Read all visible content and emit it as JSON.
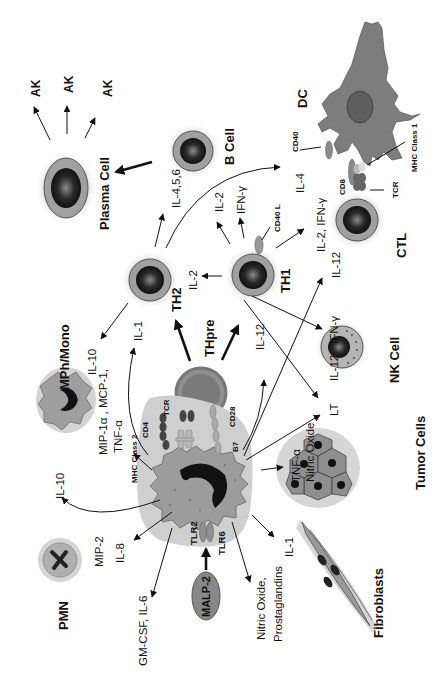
{
  "diagram": {
    "orientation": "rotated 90 degrees counter-clockwise",
    "cells": {
      "plasma_cell": "Plasma Cell",
      "b_cell": "B Cell",
      "dc": "DC",
      "th2": "TH2",
      "th1": "TH1",
      "thpre": "THpre",
      "ctl": "CTL",
      "mph_mono": "MPh/Mono",
      "nk_cell": "NK Cell",
      "pmn": "PMN",
      "tumor_cells": "Tumor Cells",
      "fibroblasts": "Fibroblasts",
      "malp2": "MALP-2"
    },
    "antibodies": [
      "AK",
      "AK",
      "AK"
    ],
    "receptors": {
      "cd40": "CD40",
      "cd40l": "CD40 L",
      "mhc1": "MHC Class 1",
      "mhc2": "MHC Class 2",
      "cd8": "CD8",
      "tcr_ctl": "TCR",
      "tcr_th": "TCR",
      "cd4": "CD4",
      "cd28": "CD28",
      "b7": "B7",
      "tlr2": "TLR2",
      "tlr6": "TLR6"
    },
    "cytokines": {
      "il456": "IL-4,5,6",
      "il2_th1_up": "IL-2",
      "ifng_th1_up": "IFN-γ",
      "il4": "IL-4",
      "il2_ifng": "IL-2, IFN-γ",
      "il12_ctl": "IL-12",
      "il2_th2": "IL-2",
      "il1_th2": "IL-1",
      "il10_mph": "IL-10",
      "mip_mcp_1": "MIP-1α , MCP-1,",
      "mip_mcp_2": "TNF-α",
      "il12_th1": "IL-12",
      "il12_nk": "IL-12",
      "ifng_nk": "IFN-γ",
      "lt": "LT",
      "tnf_no_1": "TNF-α",
      "tnf_no_2": "Nitric Oxide",
      "il10_pmn": "IL-10",
      "mip2": "MIP-2",
      "il8": "IL-8",
      "gmcsf_il6": "GM-CSF, IL-6",
      "no_pg_1": "Nitric Oxide,",
      "no_pg_2": "Prostaglandins",
      "il1_fib": "IL-1"
    },
    "colors": {
      "cell_gray": "#8a8a8a",
      "halo": "#d8d8d8",
      "nucleus": "#1a1a1a",
      "ring": "#9a9a9a",
      "dc_body": "#7d7d7d"
    }
  }
}
